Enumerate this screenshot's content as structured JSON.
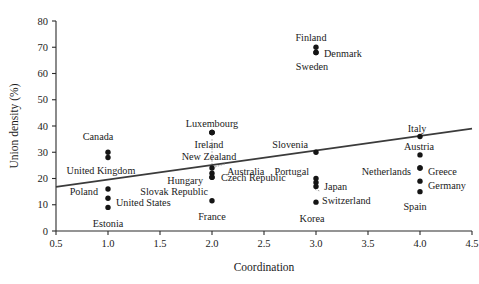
{
  "chart_data": {
    "type": "scatter",
    "title": "",
    "xlabel": "Coordination",
    "ylabel": "Union density (%)",
    "xlim": [
      0.5,
      4.5
    ],
    "ylim": [
      0,
      80
    ],
    "xticks": [
      "0.5",
      "1.0",
      "1.5",
      "2.0",
      "2.5",
      "3.0",
      "3.5",
      "4.0",
      "4.5"
    ],
    "xtick_values": [
      0.5,
      1.0,
      1.5,
      2.0,
      2.5,
      3.0,
      3.5,
      4.0,
      4.5
    ],
    "yticks": [
      "0",
      "10",
      "20",
      "30",
      "40",
      "50",
      "60",
      "70",
      "80"
    ],
    "ytick_values": [
      0,
      10,
      20,
      30,
      40,
      50,
      60,
      70,
      80
    ],
    "grid": false,
    "legend": "none",
    "marker_color": "#151515",
    "trend_color": "#3b3b3b",
    "trendline": {
      "label": "linear fit",
      "x0": 0.5,
      "y0": 16.8,
      "x1": 4.5,
      "y1": 39.0
    },
    "points": [
      {
        "label": "Canada",
        "x": 1.0,
        "y": 30.0,
        "label_dx": -10,
        "label_dy": -16,
        "anchor": "middle"
      },
      {
        "label": "United Kingdom",
        "x": 1.0,
        "y": 28.0,
        "label_dx": -7,
        "label_dy": 13,
        "anchor": "middle"
      },
      {
        "label": "Poland",
        "x": 1.0,
        "y": 16.0,
        "label_dx": -10,
        "label_dy": 3,
        "anchor": "end"
      },
      {
        "label": "United States",
        "x": 1.0,
        "y": 12.5,
        "label_dx": 8,
        "label_dy": 4,
        "anchor": "start"
      },
      {
        "label": "Estonia",
        "x": 1.0,
        "y": 9.0,
        "label_dx": 0,
        "label_dy": 16,
        "anchor": "middle"
      },
      {
        "label": "Luxembourg",
        "x": 2.0,
        "y": 37.5,
        "label_dx": 0,
        "label_dy": -9,
        "anchor": "middle"
      },
      {
        "label": "Ireland",
        "x": 2.0,
        "y": 37.5,
        "label_dx": -3,
        "label_dy": 12,
        "anchor": "middle"
      },
      {
        "label": "New Zealand",
        "x": 2.0,
        "y": 37.5,
        "label_dx": -3,
        "label_dy": 24,
        "anchor": "middle"
      },
      {
        "label": "Australia",
        "x": 2.0,
        "y": 24.0,
        "label_dx": 15,
        "label_dy": 4,
        "anchor": "start"
      },
      {
        "label": "Czech Republic",
        "x": 2.0,
        "y": 22.0,
        "label_dx": 9,
        "label_dy": 4,
        "anchor": "start"
      },
      {
        "label": "Hungary",
        "x": 2.0,
        "y": 20.5,
        "label_dx": -9,
        "label_dy": 3,
        "anchor": "end"
      },
      {
        "label": "Slovak Republic",
        "x": 2.0,
        "y": 20.5,
        "label_dx": -4,
        "label_dy": 14,
        "anchor": "end"
      },
      {
        "label": "France",
        "x": 2.0,
        "y": 11.5,
        "label_dx": 0,
        "label_dy": 16,
        "anchor": "middle"
      },
      {
        "label": "Finland",
        "x": 3.0,
        "y": 70.0,
        "label_dx": -5,
        "label_dy": -10,
        "anchor": "middle"
      },
      {
        "label": "Denmark",
        "x": 3.0,
        "y": 68.0,
        "label_dx": 8,
        "label_dy": 1,
        "anchor": "start"
      },
      {
        "label": "Sweden",
        "x": 3.0,
        "y": 68.0,
        "label_dx": -4,
        "label_dy": 14,
        "anchor": "middle"
      },
      {
        "label": "Slovenia",
        "x": 3.0,
        "y": 30.0,
        "label_dx": -8,
        "label_dy": -8,
        "anchor": "end"
      },
      {
        "label": "Portugal",
        "x": 3.0,
        "y": 20.0,
        "label_dx": -7,
        "label_dy": -7,
        "anchor": "end"
      },
      {
        "label": "Japan",
        "x": 3.0,
        "y": 18.5,
        "label_dx": 8,
        "label_dy": 4,
        "anchor": "start"
      },
      {
        "label": "Switzerland",
        "x": 3.0,
        "y": 17.0,
        "label_dx": 6,
        "label_dy": 14,
        "anchor": "start"
      },
      {
        "label": "Korea",
        "x": 3.0,
        "y": 11.0,
        "label_dx": -4,
        "label_dy": 16,
        "anchor": "middle"
      },
      {
        "label": "Italy",
        "x": 4.0,
        "y": 36.0,
        "label_dx": -3,
        "label_dy": -8,
        "anchor": "middle"
      },
      {
        "label": "Austria",
        "x": 4.0,
        "y": 29.0,
        "label_dx": -1,
        "label_dy": -8,
        "anchor": "middle"
      },
      {
        "label": "Netherlands",
        "x": 4.0,
        "y": 24.0,
        "label_dx": -9,
        "label_dy": 4,
        "anchor": "end"
      },
      {
        "label": "Greece",
        "x": 4.0,
        "y": 24.0,
        "label_dx": 8,
        "label_dy": 4,
        "anchor": "start"
      },
      {
        "label": "Germany",
        "x": 4.0,
        "y": 19.0,
        "label_dx": 8,
        "label_dy": 4,
        "anchor": "start"
      },
      {
        "label": "Spain",
        "x": 4.0,
        "y": 15.0,
        "label_dx": -5,
        "label_dy": 15,
        "anchor": "middle"
      }
    ]
  }
}
